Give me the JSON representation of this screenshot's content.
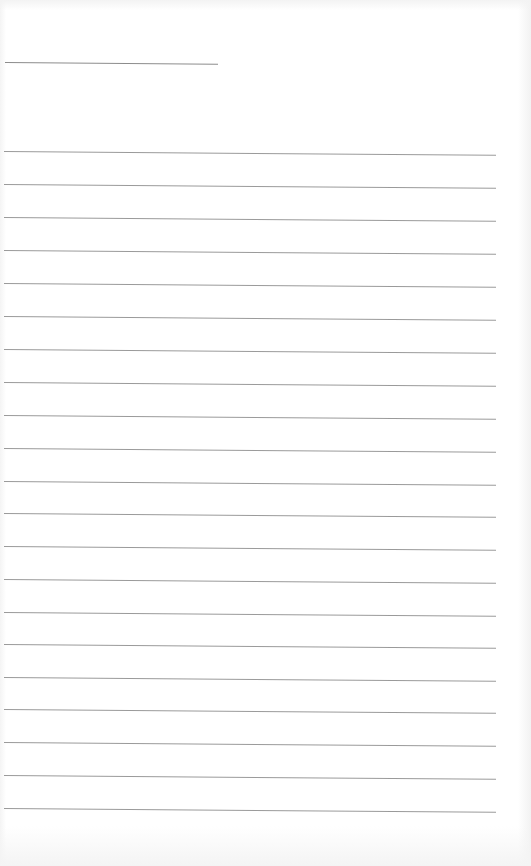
{
  "page": {
    "type": "lined-notebook-page",
    "background_color": "#ffffff",
    "line_color": "#9a9a9a",
    "header_line": {
      "text": ""
    },
    "ruled_lines": [
      {
        "text": ""
      },
      {
        "text": ""
      },
      {
        "text": ""
      },
      {
        "text": ""
      },
      {
        "text": ""
      },
      {
        "text": ""
      },
      {
        "text": ""
      },
      {
        "text": ""
      },
      {
        "text": ""
      },
      {
        "text": ""
      },
      {
        "text": ""
      },
      {
        "text": ""
      },
      {
        "text": ""
      },
      {
        "text": ""
      },
      {
        "text": ""
      },
      {
        "text": ""
      },
      {
        "text": ""
      },
      {
        "text": ""
      },
      {
        "text": ""
      },
      {
        "text": ""
      },
      {
        "text": ""
      }
    ]
  }
}
